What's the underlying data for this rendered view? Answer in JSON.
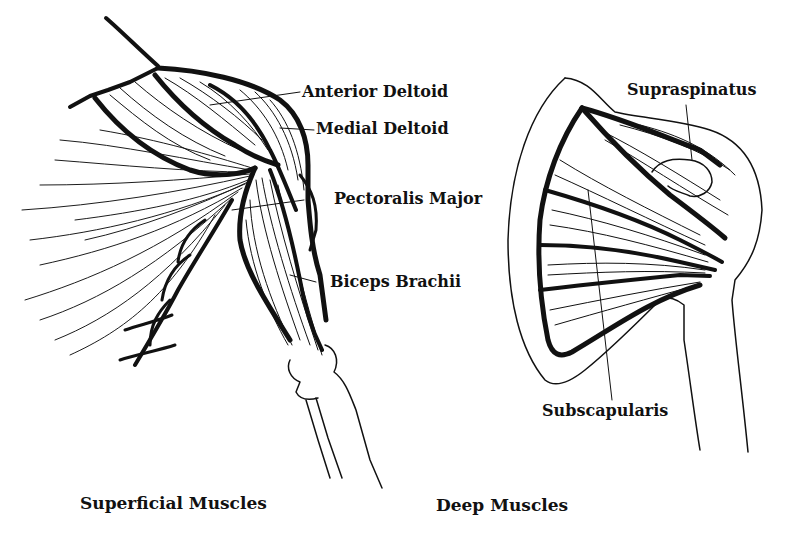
{
  "figures": [
    {
      "caption": "Superficial Muscles",
      "labels": [
        "Anterior Deltoid",
        "Medial Deltoid",
        "Pectoralis Major",
        "Biceps Brachii"
      ]
    },
    {
      "caption": "Deep Muscles",
      "labels": [
        "Supraspinatus",
        "Subscapularis"
      ]
    }
  ],
  "colors": {
    "ink": "#111111",
    "paper": "#ffffff"
  }
}
